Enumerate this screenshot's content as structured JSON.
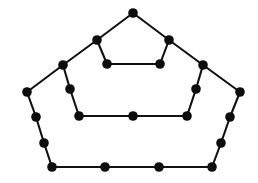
{
  "figure": {
    "background_color": "#ffffff",
    "edge_color": "#111111",
    "vertex_color": "#0d0d0d",
    "vertex_radius": 4.8,
    "edge_width": 2.1,
    "vertex_count": 25,
    "edge_count": 30,
    "width": 258,
    "height": 183
  },
  "graph_data": {
    "type": "node-link-diagram",
    "layout": "three nested pentagonal rings joined by radial spokes",
    "vertices": [
      {
        "id": "v0",
        "label": "outer-apex",
        "ring": "outer",
        "x": 133,
        "y": 13
      },
      {
        "id": "v1",
        "label": "outer-upper-left",
        "ring": "outer",
        "x": 97,
        "y": 40
      },
      {
        "id": "v2",
        "label": "outer-upper-right",
        "ring": "outer",
        "x": 169,
        "y": 40
      },
      {
        "id": "v3",
        "label": "outer-left-shoulder",
        "ring": "outer",
        "x": 63,
        "y": 65
      },
      {
        "id": "v4",
        "label": "outer-right-shoulder",
        "ring": "outer",
        "x": 203,
        "y": 65
      },
      {
        "id": "v5",
        "label": "outer-left-corner",
        "ring": "outer",
        "x": 27,
        "y": 92
      },
      {
        "id": "v6",
        "label": "outer-right-corner",
        "ring": "outer",
        "x": 240,
        "y": 92
      },
      {
        "id": "v7",
        "label": "outer-left-upper-mid",
        "ring": "outer",
        "x": 36,
        "y": 117
      },
      {
        "id": "v8",
        "label": "outer-right-upper-mid",
        "ring": "outer",
        "x": 230,
        "y": 117
      },
      {
        "id": "v9",
        "label": "outer-left-lower-mid",
        "ring": "outer",
        "x": 44,
        "y": 143
      },
      {
        "id": "v10",
        "label": "outer-right-lower-mid",
        "ring": "outer",
        "x": 221,
        "y": 143
      },
      {
        "id": "v11",
        "label": "bottom-left-corner",
        "ring": "outer",
        "x": 52,
        "y": 167
      },
      {
        "id": "v12",
        "label": "bottom-mid-left",
        "ring": "outer",
        "x": 105,
        "y": 167
      },
      {
        "id": "v13",
        "label": "bottom-mid-right",
        "ring": "outer",
        "x": 159,
        "y": 167
      },
      {
        "id": "v14",
        "label": "bottom-right-corner",
        "ring": "outer",
        "x": 212,
        "y": 167
      },
      {
        "id": "v15",
        "label": "middle-left-upper",
        "ring": "middle",
        "x": 70,
        "y": 89
      },
      {
        "id": "v16",
        "label": "middle-right-upper",
        "ring": "middle",
        "x": 196,
        "y": 89
      },
      {
        "id": "v17",
        "label": "middle-left-lower",
        "ring": "middle",
        "x": 79,
        "y": 116
      },
      {
        "id": "v18",
        "label": "middle-right-lower",
        "ring": "middle",
        "x": 187,
        "y": 116
      },
      {
        "id": "v19",
        "label": "middle-bottom-center",
        "ring": "middle",
        "x": 133,
        "y": 116
      },
      {
        "id": "v20",
        "label": "inner-left",
        "ring": "inner",
        "x": 107,
        "y": 64
      },
      {
        "id": "v21",
        "label": "inner-right",
        "ring": "inner",
        "x": 160,
        "y": 64
      }
    ],
    "edges": [
      {
        "from": "v0",
        "to": "v1",
        "kind": "outer-ring"
      },
      {
        "from": "v0",
        "to": "v2",
        "kind": "outer-ring"
      },
      {
        "from": "v1",
        "to": "v3",
        "kind": "outer-ring"
      },
      {
        "from": "v2",
        "to": "v4",
        "kind": "outer-ring"
      },
      {
        "from": "v3",
        "to": "v5",
        "kind": "outer-ring"
      },
      {
        "from": "v4",
        "to": "v6",
        "kind": "outer-ring"
      },
      {
        "from": "v5",
        "to": "v7",
        "kind": "outer-ring"
      },
      {
        "from": "v6",
        "to": "v8",
        "kind": "outer-ring"
      },
      {
        "from": "v7",
        "to": "v9",
        "kind": "outer-ring"
      },
      {
        "from": "v8",
        "to": "v10",
        "kind": "outer-ring"
      },
      {
        "from": "v9",
        "to": "v11",
        "kind": "outer-ring"
      },
      {
        "from": "v10",
        "to": "v14",
        "kind": "outer-ring"
      },
      {
        "from": "v11",
        "to": "v12",
        "kind": "outer-ring"
      },
      {
        "from": "v12",
        "to": "v13",
        "kind": "outer-ring"
      },
      {
        "from": "v13",
        "to": "v14",
        "kind": "outer-ring"
      },
      {
        "from": "v3",
        "to": "v15",
        "kind": "spoke"
      },
      {
        "from": "v4",
        "to": "v16",
        "kind": "spoke"
      },
      {
        "from": "v15",
        "to": "v17",
        "kind": "middle-ring"
      },
      {
        "from": "v16",
        "to": "v18",
        "kind": "middle-ring"
      },
      {
        "from": "v17",
        "to": "v19",
        "kind": "middle-ring"
      },
      {
        "from": "v19",
        "to": "v18",
        "kind": "middle-ring"
      },
      {
        "from": "v1",
        "to": "v20",
        "kind": "spoke"
      },
      {
        "from": "v2",
        "to": "v21",
        "kind": "spoke"
      },
      {
        "from": "v20",
        "to": "v21",
        "kind": "inner-ring"
      }
    ]
  }
}
